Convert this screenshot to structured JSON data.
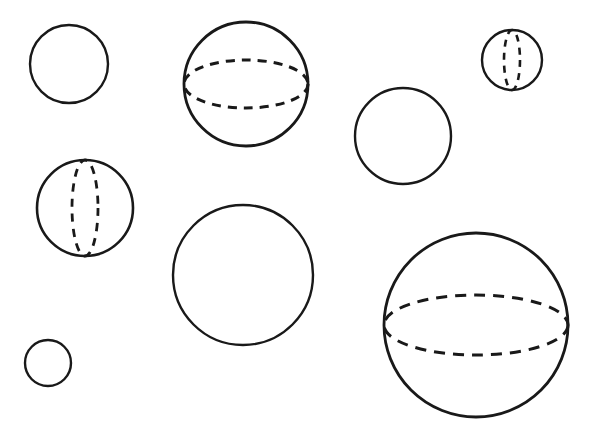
{
  "figure": {
    "canvas": {
      "width": 594,
      "height": 433,
      "background": "#ffffff"
    },
    "stroke_color": "#191919",
    "shape_count": 8,
    "shapes": [
      {
        "id": "circle-small-top-left",
        "kind": "circle",
        "label": "Plain circle, upper left",
        "cx": 69,
        "cy": 64,
        "r": 39,
        "stroke_width": 2.4,
        "equator": null
      },
      {
        "id": "sphere-horizontal-top-center",
        "kind": "sphere",
        "label": "Sphere with horizontal dashed equator, top center",
        "cx": 246,
        "cy": 84,
        "r": 62,
        "stroke_width": 2.8,
        "equator": {
          "orientation": "horizontal",
          "rx": 62,
          "ry": 24,
          "dash": "9 7",
          "stroke_width": 3.0
        }
      },
      {
        "id": "sphere-vertical-top-right",
        "kind": "sphere",
        "label": "Small sphere with vertical dashed meridian, top right",
        "cx": 512,
        "cy": 60,
        "r": 30,
        "stroke_width": 2.4,
        "equator": {
          "orientation": "vertical",
          "rx": 8,
          "ry": 30,
          "dash": "7 6",
          "stroke_width": 2.6
        }
      },
      {
        "id": "circle-medium-right",
        "kind": "circle",
        "label": "Plain circle, right of center",
        "cx": 403,
        "cy": 136,
        "r": 48,
        "stroke_width": 2.4,
        "equator": null
      },
      {
        "id": "sphere-vertical-middle-left",
        "kind": "sphere",
        "label": "Sphere with vertical dashed meridian, middle left",
        "cx": 85,
        "cy": 208,
        "r": 48,
        "stroke_width": 2.6,
        "equator": {
          "orientation": "vertical",
          "rx": 13,
          "ry": 48,
          "dash": "8 7",
          "stroke_width": 2.8
        }
      },
      {
        "id": "circle-large-center",
        "kind": "circle",
        "label": "Plain circle, lower center",
        "cx": 243,
        "cy": 275,
        "r": 70,
        "stroke_width": 2.4,
        "equator": null
      },
      {
        "id": "sphere-horizontal-bottom-right",
        "kind": "sphere",
        "label": "Large sphere with horizontal dashed equator, bottom right",
        "cx": 476,
        "cy": 325,
        "r": 92,
        "stroke_width": 2.8,
        "equator": {
          "orientation": "horizontal",
          "rx": 92,
          "ry": 30,
          "dash": "11 8",
          "stroke_width": 3.0
        }
      },
      {
        "id": "circle-tiny-bottom-left",
        "kind": "circle",
        "label": "Small plain circle, bottom left",
        "cx": 48,
        "cy": 363,
        "r": 23,
        "stroke_width": 2.4,
        "equator": null
      }
    ]
  }
}
